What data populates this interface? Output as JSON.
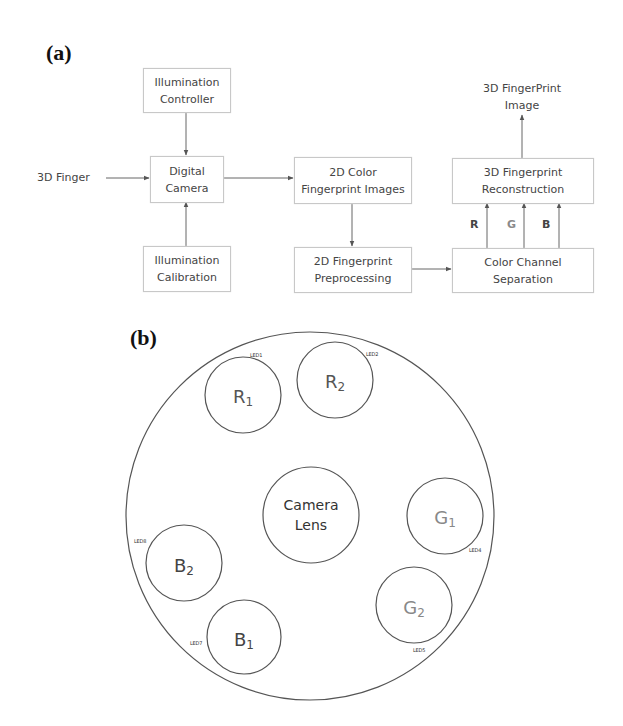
{
  "panel_a": {
    "label": "(a)",
    "input_text": "3D Finger",
    "output_text_line1": "3D FingerPrint",
    "output_text_line2": "Image",
    "boxes": {
      "illum_controller": {
        "line1": "Illumination",
        "line2": "Controller"
      },
      "digital_camera": {
        "line1": "Digital",
        "line2": "Camera"
      },
      "illum_calibration": {
        "line1": "Illumination",
        "line2": "Calibration"
      },
      "color_images": {
        "line1": "2D Color",
        "line2": "Fingerprint Images"
      },
      "preprocessing": {
        "line1": "2D Fingerprint",
        "line2": "Preprocessing"
      },
      "reconstruction": {
        "line1": "3D Fingerprint",
        "line2": "Reconstruction"
      },
      "channel_separation": {
        "line1": "Color Channel",
        "line2": "Separation"
      }
    },
    "channels": [
      {
        "label": "R",
        "color": "#444444"
      },
      {
        "label": "G",
        "color": "#8a8a8a"
      },
      {
        "label": "B",
        "color": "#444444"
      }
    ]
  },
  "panel_b": {
    "label": "(b)",
    "lens": {
      "line1": "Camera",
      "line2": "Lens"
    },
    "leds": [
      {
        "name": "R",
        "sub": "1",
        "led": "LED1",
        "color": "#555555"
      },
      {
        "name": "R",
        "sub": "2",
        "led": "LED2",
        "color": "#555555"
      },
      {
        "name": "G",
        "sub": "1",
        "led": "LED4",
        "color": "#888888"
      },
      {
        "name": "G",
        "sub": "2",
        "led": "LED5",
        "color": "#888888"
      },
      {
        "name": "B",
        "sub": "1",
        "led": "LED7",
        "color": "#444444"
      },
      {
        "name": "B",
        "sub": "2",
        "led": "LED8",
        "color": "#444444"
      }
    ]
  }
}
